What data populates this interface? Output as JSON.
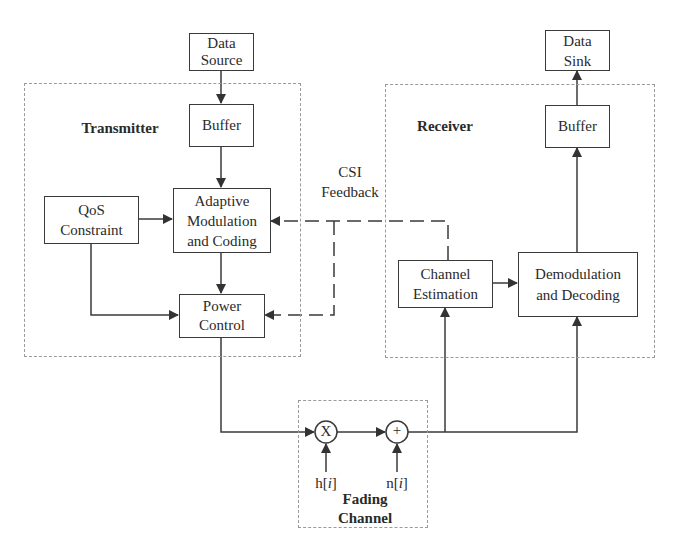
{
  "diagram": {
    "type": "block-diagram",
    "groups": {
      "transmitter": "Transmitter",
      "receiver": "Receiver",
      "fading_channel": [
        "Fading",
        "Channel"
      ]
    },
    "blocks": {
      "data_source": [
        "Data",
        "Source"
      ],
      "tx_buffer": [
        "Buffer"
      ],
      "qos": [
        "QoS",
        "Constraint"
      ],
      "amc": [
        "Adaptive",
        "Modulation",
        "and Coding"
      ],
      "power_control": [
        "Power",
        "Control"
      ],
      "data_sink": [
        "Data",
        "Sink"
      ],
      "rx_buffer": [
        "Buffer"
      ],
      "channel_estimation": [
        "Channel",
        "Estimation"
      ],
      "demod": [
        "Demodulation",
        "and Decoding"
      ]
    },
    "operators": {
      "multiply": "X",
      "add": "+"
    },
    "signals": {
      "fading": "h[i]",
      "noise": "n[i]",
      "h_base": "h[",
      "n_base": "n[",
      "idx": "i",
      "close": "]"
    },
    "feedback_label": [
      "CSI",
      "Feedback"
    ],
    "edges": [
      {
        "from": "Data Source",
        "to": "Buffer (TX)"
      },
      {
        "from": "Buffer (TX)",
        "to": "Adaptive Modulation and Coding"
      },
      {
        "from": "QoS Constraint",
        "to": "Adaptive Modulation and Coding"
      },
      {
        "from": "QoS Constraint",
        "to": "Power Control"
      },
      {
        "from": "Adaptive Modulation and Coding",
        "to": "Power Control"
      },
      {
        "from": "Power Control",
        "to": "Multiplier (X)"
      },
      {
        "from": "h[i]",
        "to": "Multiplier (X)"
      },
      {
        "from": "Multiplier (X)",
        "to": "Adder (+)"
      },
      {
        "from": "n[i]",
        "to": "Adder (+)"
      },
      {
        "from": "Adder (+)",
        "to": "Channel Estimation"
      },
      {
        "from": "Adder (+)",
        "to": "Demodulation and Decoding"
      },
      {
        "from": "Channel Estimation",
        "to": "Demodulation and Decoding"
      },
      {
        "from": "Demodulation and Decoding",
        "to": "Buffer (RX)"
      },
      {
        "from": "Buffer (RX)",
        "to": "Data Sink"
      },
      {
        "from": "Channel Estimation",
        "to": "Adaptive Modulation and Coding",
        "style": "dashed",
        "label": "CSI Feedback"
      },
      {
        "from": "Channel Estimation",
        "to": "Power Control",
        "style": "dashed",
        "label": "CSI Feedback"
      }
    ],
    "colors": {
      "line": "#3a3a3a",
      "group_border": "#9a9a9a",
      "background": "#ffffff"
    }
  }
}
